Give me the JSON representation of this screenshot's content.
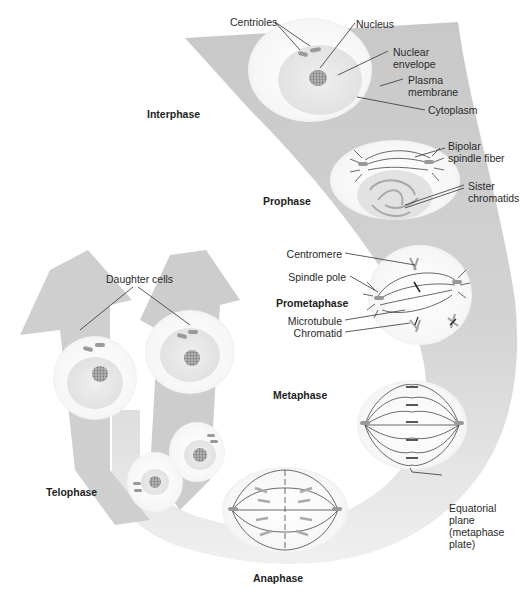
{
  "figure": {
    "colors": {
      "band": "#c9c9c9",
      "band_light": "#e4e4e4",
      "cell": "#f7f7f7",
      "nucleus": "#e6e6e6",
      "chromatin": "#9a9a9a",
      "line": "#333333"
    }
  },
  "phases": {
    "interphase": "Interphase",
    "prophase": "Prophase",
    "prometaphase": "Prometaphase",
    "metaphase": "Metaphase",
    "anaphase": "Anaphase",
    "telophase": "Telophase"
  },
  "labels": {
    "centrioles": "Centrioles",
    "nucleus": "Nucleus",
    "nuclear_envelope": "Nuclear\nenvelope",
    "plasma_membrane": "Plasma\nmembrane",
    "cytoplasm": "Cytoplasm",
    "bipolar_spindle_fiber": "Bipolar\nspindle fiber",
    "sister_chromatids": "Sister\nchromatids",
    "centromere": "Centromere",
    "spindle_pole": "Spindle pole",
    "microtubule": "Microtubule",
    "chromatid": "Chromatid",
    "equatorial_plane": "Equatorial\nplane\n(metaphase\nplate)",
    "daughter_cells": "Daughter cells"
  }
}
